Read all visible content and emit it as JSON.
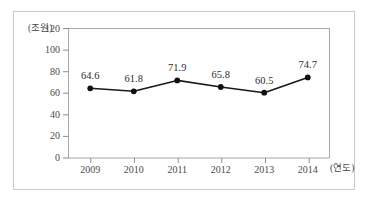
{
  "clipped_caption": "ㅡ ㅡ ㅡ ㅡ ㅡ ㅡ ㅡ",
  "chart_data": {
    "type": "line",
    "title": "",
    "subtitle": "",
    "xlabel": "(연도)",
    "ylabel": "(조원)",
    "categories": [
      "2009",
      "2010",
      "2011",
      "2012",
      "2013",
      "2014"
    ],
    "values": [
      64.6,
      61.8,
      71.9,
      65.8,
      60.5,
      74.7
    ],
    "point_labels": [
      "64.6",
      "61.8",
      "71.9",
      "65.8",
      "60.5",
      "74.7"
    ],
    "series": [
      {
        "name": "",
        "values": [
          64.6,
          61.8,
          71.9,
          65.8,
          60.5,
          74.7
        ]
      }
    ],
    "ylim": [
      0,
      120
    ],
    "y_ticks": [
      "0",
      "20",
      "40",
      "60",
      "80",
      "100",
      "120"
    ],
    "y_tick_values": [
      0,
      20,
      40,
      60,
      80,
      100,
      120
    ],
    "grid": false,
    "legend": "none",
    "marker": "filled-circle",
    "line_color": "#1a1a1a",
    "marker_color": "#111111",
    "axis_color": "#8d8d8d",
    "frame_color": "#c9c9c9",
    "text_color": "#4a4a4a"
  }
}
